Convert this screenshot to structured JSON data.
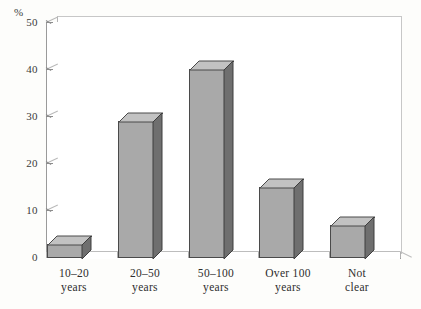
{
  "chart_data": {
    "type": "bar",
    "title": "",
    "subtitle": "",
    "xlabel": "",
    "ylabel": "%",
    "categories": [
      "10–20 years",
      "20–50 years",
      "50–100 years",
      "Over 100 years",
      "Not clear"
    ],
    "category_lines": [
      [
        "10–20",
        "years"
      ],
      [
        "20–50",
        "years"
      ],
      [
        "50–100",
        "years"
      ],
      [
        "Over 100",
        "years"
      ],
      [
        "Not",
        "clear"
      ]
    ],
    "values": [
      3,
      29,
      40,
      15,
      7
    ],
    "ylim": [
      0,
      50
    ],
    "yticks": [
      0,
      10,
      20,
      30,
      40,
      50
    ],
    "ytick_labels": [
      "0",
      "10",
      "20",
      "30",
      "40",
      "50"
    ],
    "grid": true,
    "legend": "none",
    "style": "3d-column",
    "colors": {
      "bar_front": "#a9a9a9",
      "bar_top": "#c2c2c2",
      "bar_side": "#6f6f6f",
      "bar_outline": "#4a4a4a",
      "gridline": "#c9c9c9",
      "axis": "#9a9a9a",
      "background": "#ffffff",
      "text": "#2e2e2e"
    }
  },
  "axis": {
    "unit_symbol": "%"
  }
}
